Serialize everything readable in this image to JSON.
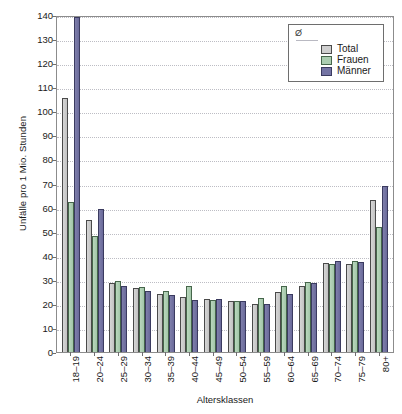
{
  "chart_data": {
    "type": "bar",
    "title": "",
    "xlabel": "Altersklassen",
    "ylabel": "Unfälle pro 1 Mio. Stunden",
    "ylim": [
      0,
      140
    ],
    "ytick_step": 10,
    "yticks": [
      140,
      130,
      120,
      110,
      100,
      90,
      80,
      70,
      60,
      50,
      40,
      30,
      20,
      10,
      0
    ],
    "grid": true,
    "legend_position": "top-right",
    "legend_mean_symbol": "Ø",
    "categories": [
      "18–19",
      "20–24",
      "25–29",
      "30–34",
      "35–39",
      "40–44",
      "45–49",
      "50–54",
      "55–59",
      "60–64",
      "65–69",
      "70–74",
      "75–79",
      "80+"
    ],
    "series": [
      {
        "name": "Total",
        "color": "#cfcfcf",
        "values": [
          105.5,
          55.0,
          28.5,
          26.5,
          24.0,
          23.0,
          22.0,
          21.0,
          20.0,
          25.0,
          27.5,
          37.0,
          36.5,
          63.0
        ]
      },
      {
        "name": "Frauen",
        "color": "#abcdb1",
        "values": [
          62.5,
          48.0,
          29.5,
          27.0,
          25.5,
          27.5,
          21.5,
          21.0,
          22.5,
          27.5,
          29.0,
          36.5,
          38.0,
          52.0
        ]
      },
      {
        "name": "Männer",
        "color": "#7474a4",
        "values": [
          139.0,
          59.5,
          27.5,
          25.5,
          23.5,
          21.5,
          22.0,
          21.0,
          20.0,
          24.0,
          28.5,
          38.0,
          37.5,
          69.0
        ]
      }
    ]
  },
  "footnote": ""
}
